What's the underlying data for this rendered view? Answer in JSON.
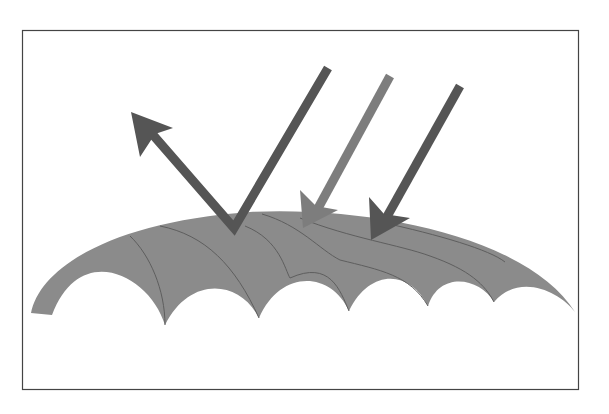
{
  "diagram": {
    "colors": {
      "background": "#ffffff",
      "frame": "#444444",
      "leaf": "#8b8b8b",
      "vein": "#5e5e5e",
      "arrow_dark": "#555555",
      "arrow_light": "#7d7d7d"
    },
    "elements": {
      "frame": {
        "x": 22,
        "y": 30,
        "width": 557,
        "height": 360
      },
      "leaf": {
        "description": "curved leaf cross-section with scalloped underside"
      },
      "incident_arrow_reflected": {
        "start": [
          328,
          68
        ],
        "vertex": [
          234,
          230
        ],
        "reflected_tip": [
          131,
          112
        ]
      },
      "incident_arrow_absorbed_light": {
        "start": [
          390,
          76
        ],
        "tip": [
          304,
          228
        ]
      },
      "incident_arrow_absorbed_dark": {
        "start": [
          460,
          86
        ],
        "tip": [
          371,
          240
        ]
      }
    }
  }
}
